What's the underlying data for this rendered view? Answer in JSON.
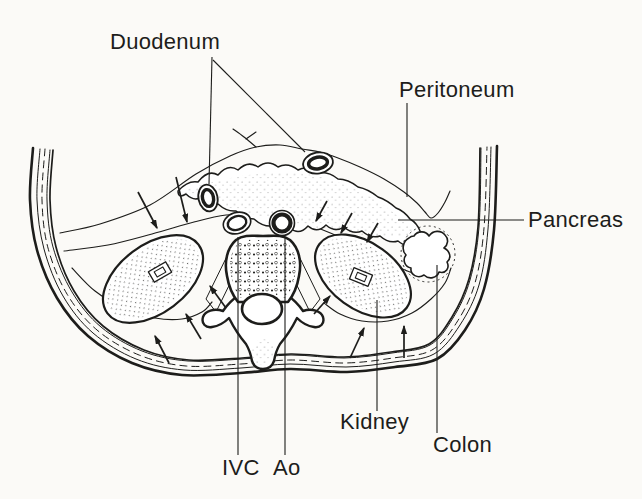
{
  "figure": {
    "type": "anatomical-cross-section-diagram",
    "ink_color": "#1d1d1b",
    "paper_color": "#fbfaf7",
    "labels": {
      "duodenum": "Duodenum",
      "peritoneum": "Peritoneum",
      "pancreas": "Pancreas",
      "kidney": "Kidney",
      "colon": "Colon",
      "ivc": "IVC",
      "ao": "Ao"
    }
  }
}
